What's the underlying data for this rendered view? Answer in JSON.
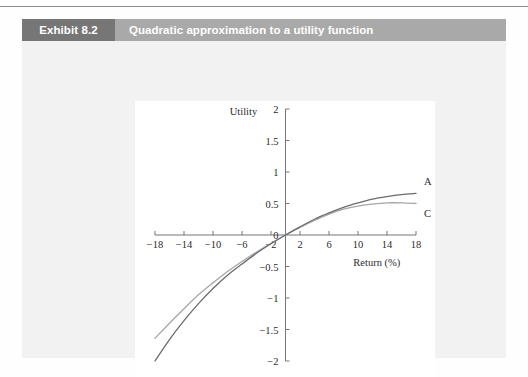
{
  "exhibit": {
    "tag": "Exhibit 8.2",
    "title": "Quadratic approximation to a utility function"
  },
  "chart_data": {
    "type": "line",
    "title": "Quadratic approximation to a utility function",
    "xlabel": "Return (%)",
    "ylabel": "Utility",
    "xlim": [
      -18,
      18
    ],
    "ylim": [
      -2,
      2
    ],
    "xticks": [
      "-18",
      "-14",
      "-10",
      "-6",
      "-2",
      "2",
      "6",
      "10",
      "14",
      "18"
    ],
    "xtick_values": [
      -18,
      -14,
      -10,
      -6,
      -2,
      2,
      6,
      10,
      14,
      18
    ],
    "yticks": [
      "2",
      "1.5",
      "1",
      "0.5",
      "0",
      "-0.5",
      "-1",
      "-1.5",
      "-2"
    ],
    "ytick_values": [
      2,
      1.5,
      1,
      0.5,
      0,
      -0.5,
      -1,
      -1.5,
      -2
    ],
    "grid": false,
    "legend_position": "inline-right",
    "series": [
      {
        "name": "A",
        "label": "A",
        "color": "#6b6b70",
        "annotation": "A",
        "x": [
          -18,
          -16,
          -14,
          -12,
          -10,
          -8,
          -6,
          -4,
          -2,
          0,
          2,
          4,
          6,
          8,
          10,
          12,
          14,
          16,
          18
        ],
        "values": [
          -2.0,
          -1.66,
          -1.36,
          -1.09,
          -0.85,
          -0.64,
          -0.46,
          -0.29,
          -0.14,
          0.0,
          0.13,
          0.25,
          0.35,
          0.44,
          0.51,
          0.57,
          0.61,
          0.64,
          0.66
        ]
      },
      {
        "name": "C",
        "label": "C",
        "color": "#a6a6aa",
        "annotation": "C",
        "x": [
          -18,
          -16,
          -14,
          -12,
          -10,
          -8,
          -6,
          -4,
          -2,
          0,
          2,
          4,
          6,
          8,
          10,
          12,
          14,
          16,
          18
        ],
        "values": [
          -1.64,
          -1.4,
          -1.17,
          -0.95,
          -0.76,
          -0.58,
          -0.42,
          -0.27,
          -0.13,
          0.0,
          0.12,
          0.23,
          0.33,
          0.41,
          0.46,
          0.49,
          0.51,
          0.51,
          0.5
        ]
      }
    ]
  }
}
